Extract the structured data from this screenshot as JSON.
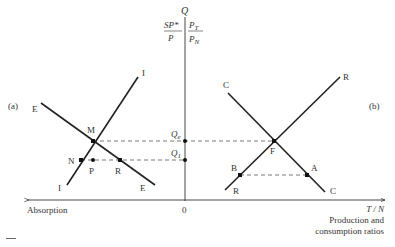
{
  "diagram": {
    "vertical_axis": {
      "top_label": "Q",
      "left_ratio": {
        "num": "SP*",
        "den": "P"
      },
      "right_ratio": {
        "num": "P",
        "num_sub": "T",
        "den": "P",
        "den_sub": "N"
      },
      "origin_label": "0"
    },
    "horizontal_axis": {
      "left_label": "Absorption",
      "right_label_top": "T / N",
      "right_label_line1": "Production and",
      "right_label_line2": "consumption ratios"
    },
    "panel_a": {
      "label": "(a)",
      "curves": [
        {
          "name": "E",
          "start_label": "E",
          "end_label": "E"
        },
        {
          "name": "I",
          "start_label": "I",
          "end_label": "I"
        }
      ],
      "points": {
        "M": "M",
        "N": "N",
        "P": "P",
        "R": "R"
      }
    },
    "panel_b": {
      "label": "(b)",
      "curves": [
        {
          "name": "C",
          "start_label": "C",
          "end_label": "C"
        },
        {
          "name": "R",
          "start_label": "R",
          "end_label": "R"
        }
      ],
      "points": {
        "F": "F",
        "B": "B",
        "A": "A"
      }
    },
    "axis_points": {
      "Qe": {
        "main": "Q",
        "sub": "e"
      },
      "Q1": {
        "main": "Q",
        "sub": "1"
      }
    }
  }
}
